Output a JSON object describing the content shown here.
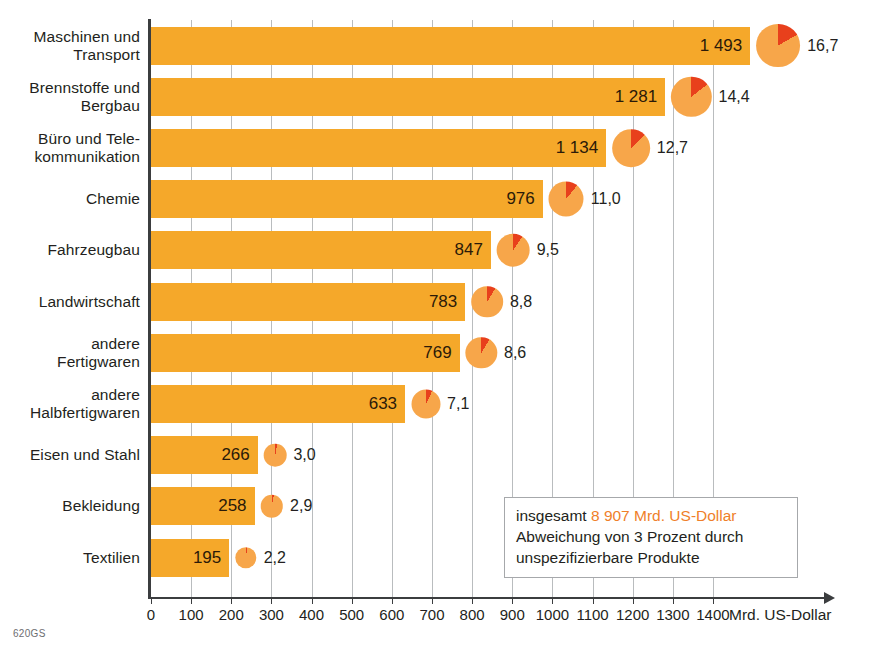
{
  "chart_data": {
    "type": "bar",
    "title": "",
    "xlabel": "Mrd. US-Dollar",
    "ylabel": "",
    "xlim": [
      0,
      1400
    ],
    "xticks": [
      0,
      100,
      200,
      300,
      400,
      500,
      600,
      700,
      800,
      900,
      1000,
      1100,
      1200,
      1300,
      1400
    ],
    "grid": true,
    "legend_position": "inside-bottom-right",
    "orientation": "horizontal",
    "categories": [
      "Maschinen und\nTransport",
      "Brennstoffe und\nBergbau",
      "Büro und Tele-\nkommunikation",
      "Chemie",
      "Fahrzeugbau",
      "Landwirtschaft",
      "andere\nFertigwaren",
      "andere\nHalbfertigwaren",
      "Eisen und Stahl",
      "Bekleidung",
      "Textilien"
    ],
    "series": [
      {
        "name": "Mrd. US-Dollar",
        "values": [
          1493,
          1281,
          1134,
          976,
          847,
          783,
          769,
          633,
          266,
          258,
          195
        ]
      },
      {
        "name": "Anteil in Prozent",
        "values": [
          16.7,
          14.4,
          12.7,
          11.0,
          9.5,
          8.8,
          8.6,
          7.1,
          3.0,
          2.9,
          2.2
        ]
      }
    ],
    "value_labels": [
      "1 493",
      "1 281",
      "1 134",
      "976",
      "847",
      "783",
      "769",
      "633",
      "266",
      "258",
      "195"
    ],
    "percent_labels": [
      "16,7",
      "14,4",
      "12,7",
      "11,0",
      "9,5",
      "8,8",
      "8,6",
      "7,1",
      "3,0",
      "2,9",
      "2,2"
    ],
    "colors": {
      "bar": "#f5a82a",
      "pie_base": "#f7a64a",
      "pie_slice": "#e8401c",
      "gridline": "#b9bcbe",
      "axis": "#3b3d3f",
      "accent_text": "#ef7f2a"
    }
  },
  "rows": [
    {
      "label_line1": "Maschinen und",
      "label_line2": "Transport",
      "value": "1 493",
      "percent": "16,7"
    },
    {
      "label_line1": "Brennstoffe und",
      "label_line2": "Bergbau",
      "value": "1 281",
      "percent": "14,4"
    },
    {
      "label_line1": "Büro und Tele-",
      "label_line2": "kommunikation",
      "value": "1 134",
      "percent": "12,7"
    },
    {
      "label_line1": "Chemie",
      "label_line2": "",
      "value": "976",
      "percent": "11,0"
    },
    {
      "label_line1": "Fahrzeugbau",
      "label_line2": "",
      "value": "847",
      "percent": "9,5"
    },
    {
      "label_line1": "Landwirtschaft",
      "label_line2": "",
      "value": "783",
      "percent": "8,8"
    },
    {
      "label_line1": "andere",
      "label_line2": "Fertigwaren",
      "value": "769",
      "percent": "8,6"
    },
    {
      "label_line1": "andere",
      "label_line2": "Halbfertigwaren",
      "value": "633",
      "percent": "7,1"
    },
    {
      "label_line1": "Eisen und Stahl",
      "label_line2": "",
      "value": "266",
      "percent": "3,0"
    },
    {
      "label_line1": "Bekleidung",
      "label_line2": "",
      "value": "258",
      "percent": "2,9"
    },
    {
      "label_line1": "Textilien",
      "label_line2": "",
      "value": "195",
      "percent": "2,2"
    }
  ],
  "axis": {
    "unit_label": "Mrd. US-Dollar",
    "ticks": [
      "0",
      "100",
      "200",
      "300",
      "400",
      "500",
      "600",
      "700",
      "800",
      "900",
      "1000",
      "1100",
      "1200",
      "1300",
      "1400"
    ]
  },
  "legend": {
    "prefix": "insgesamt ",
    "total": "8 907 Mrd. US-Dollar",
    "note_line1": "Abweichung von 3 Prozent durch",
    "note_line2": "unspezifizierbare Produkte"
  },
  "source_code": "620GS"
}
